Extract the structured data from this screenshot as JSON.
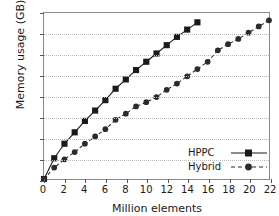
{
  "chart_data": {
    "type": "line",
    "title": "",
    "xlabel": "Million elements",
    "ylabel": "Memory usage (GB)",
    "xlim": [
      0,
      22
    ],
    "ylim": [
      0.0,
      1.6
    ],
    "xticks": [
      0,
      2,
      4,
      6,
      8,
      10,
      12,
      14,
      16,
      18,
      20,
      22
    ],
    "xtick_labels": [
      "0",
      "2",
      "4",
      "6",
      "8",
      "10",
      "12",
      "14",
      "16",
      "18",
      "20",
      "22"
    ],
    "yticks": [
      0.0,
      0.2,
      0.4,
      0.6,
      0.8,
      1.0,
      1.2,
      1.4,
      1.6
    ],
    "ytick_labels": [
      "0.0",
      "0.2",
      "0.4",
      "0.6",
      "0.8",
      "1.0",
      "1.2",
      "1.4",
      "1.6"
    ],
    "grid": true,
    "grid_axis": "y",
    "legend_position": "lower-right",
    "series": [
      {
        "name": "HPPC",
        "marker": "square",
        "linestyle": "solid",
        "color": "#1a1a1a",
        "x": [
          0,
          1,
          2,
          3,
          4,
          5,
          6,
          7,
          8,
          9,
          10,
          11,
          12,
          13,
          14,
          15
        ],
        "values": [
          0.0,
          0.2,
          0.34,
          0.45,
          0.56,
          0.66,
          0.76,
          0.87,
          0.96,
          1.05,
          1.13,
          1.21,
          1.29,
          1.37,
          1.44,
          1.51
        ]
      },
      {
        "name": "Hybrid",
        "marker": "circle",
        "linestyle": "dashed",
        "color": "#2b2b2b",
        "x": [
          0,
          1,
          2,
          3,
          4,
          5,
          6,
          7,
          8,
          9,
          10,
          11,
          12,
          13,
          14,
          15,
          16,
          17,
          18,
          19,
          20,
          21,
          22
        ],
        "values": [
          0.0,
          0.11,
          0.19,
          0.26,
          0.34,
          0.41,
          0.48,
          0.57,
          0.63,
          0.7,
          0.74,
          0.79,
          0.86,
          0.92,
          0.99,
          1.06,
          1.13,
          1.24,
          1.3,
          1.35,
          1.41,
          1.47,
          1.53
        ]
      }
    ]
  },
  "legend": {
    "items": [
      {
        "label": "HPPC"
      },
      {
        "label": "Hybrid"
      }
    ]
  }
}
